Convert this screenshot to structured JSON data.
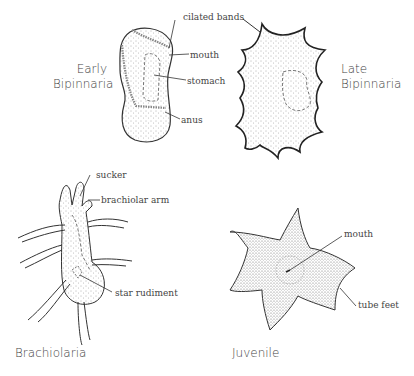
{
  "stages": [
    {
      "name": "Early Bipinnaria",
      "line1": "Early",
      "line2": "Bipinnaria"
    },
    {
      "name": "Late Bipinnaria",
      "line1": "Late",
      "line2": "Bipinnaria"
    },
    {
      "name": "Brachiolaria"
    },
    {
      "name": "Juvenile"
    }
  ],
  "labels": {
    "ciliated_bands": "cilated bands",
    "mouth_early": "mouth",
    "stomach": "stomach",
    "anus": "anus",
    "sucker": "sucker",
    "brachiolar_arm": "brachiolar arm",
    "star_rudiment": "star rudiment",
    "mouth_juvenile": "mouth",
    "tube_feet": "tube feet"
  }
}
